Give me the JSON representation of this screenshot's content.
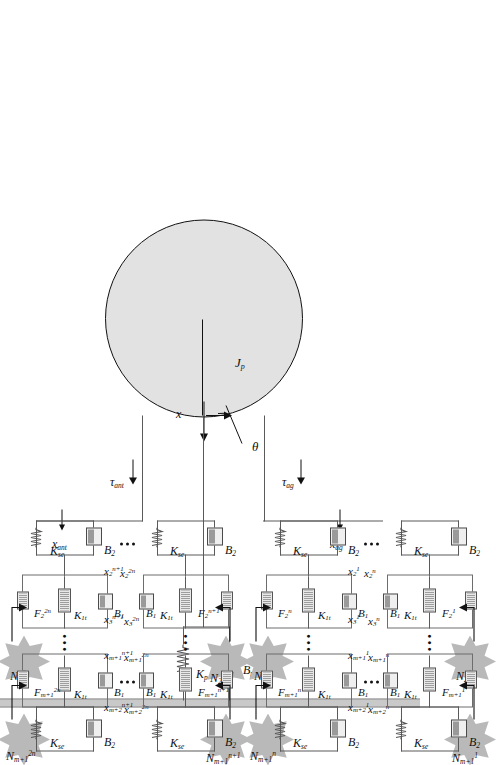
{
  "figure": {
    "type": "biomechanical-muscle-model-diagram",
    "orientation": "rotated-90-ccw",
    "rotor": {
      "inertia_label": "J",
      "inertia_sub": "p",
      "angle_label": "θ",
      "displacement_label": "x"
    },
    "torques": [
      {
        "name": "tau-antagonist",
        "base": "τ",
        "sub": "ant"
      },
      {
        "name": "tau-agonist",
        "base": "τ",
        "sub": "ag"
      }
    ],
    "tendon_displacements": [
      {
        "name": "x-antagonist",
        "base": "x",
        "sub": "ant"
      },
      {
        "name": "x-agonist",
        "base": "x",
        "sub": "ag"
      }
    ],
    "passive_elements": [
      {
        "name": "passive-stiffness",
        "base": "K",
        "sub": "p",
        "kind": "spring"
      },
      {
        "name": "passive-damping",
        "base": "B",
        "sub": "p",
        "kind": "damper"
      }
    ],
    "series_elements": {
      "base": "K",
      "sub": "se",
      "kind": "spring"
    },
    "parallel_damper": {
      "base": "B",
      "sub": "2",
      "kind": "damper"
    },
    "contractile_stiffness": {
      "base": "K",
      "sub": "1t",
      "kind": "spring"
    },
    "contractile_damper": {
      "base": "B",
      "sub": "1",
      "kind": "damper"
    },
    "ellipsis": "•••",
    "groups": [
      {
        "name": "antagonist-upper-group",
        "layer_sup": "2n",
        "forces": [
          {
            "base": "F",
            "sub": "2",
            "sup": "2n"
          },
          {
            "base": "F",
            "sub": "m+1",
            "sup": "2n"
          }
        ],
        "neural_inputs": [
          {
            "base": "N",
            "sub": "2",
            "sup": "2n"
          },
          {
            "base": "N",
            "sub": "m+1",
            "sup": "2n"
          }
        ],
        "node_displacements": [
          {
            "base": "x",
            "sub": "2",
            "sup": "2n"
          },
          {
            "base": "x",
            "sub": "3",
            "sup": "2n"
          },
          {
            "base": "x",
            "sub": "m+1",
            "sup": "2n"
          },
          {
            "base": "x",
            "sub": "m+2",
            "sup": "2n"
          }
        ]
      },
      {
        "name": "antagonist-lower-group",
        "layer_sup": "n+1",
        "forces": [
          {
            "base": "F",
            "sub": "2",
            "sup": "n+1"
          },
          {
            "base": "F",
            "sub": "m+1",
            "sup": "n+1"
          }
        ],
        "neural_inputs": [
          {
            "base": "N",
            "sub": "2",
            "sup": "n+1"
          },
          {
            "base": "N",
            "sub": "m+1",
            "sup": "n+1"
          }
        ],
        "node_displacements": [
          {
            "base": "x",
            "sub": "2",
            "sup": "n+1"
          },
          {
            "base": "x",
            "sub": "3",
            "sup": "n+1"
          },
          {
            "base": "x",
            "sub": "m+1",
            "sup": "n+1"
          },
          {
            "base": "x",
            "sub": "m+2",
            "sup": "n+1"
          }
        ]
      },
      {
        "name": "agonist-upper-group",
        "layer_sup": "n",
        "forces": [
          {
            "base": "F",
            "sub": "2",
            "sup": "n"
          },
          {
            "base": "F",
            "sub": "m+1",
            "sup": "n"
          }
        ],
        "neural_inputs": [
          {
            "base": "N",
            "sub": "2",
            "sup": "n"
          },
          {
            "base": "N",
            "sub": "m+1",
            "sup": "n"
          }
        ],
        "node_displacements": [
          {
            "base": "x",
            "sub": "2",
            "sup": "n"
          },
          {
            "base": "x",
            "sub": "3",
            "sup": "n"
          },
          {
            "base": "x",
            "sub": "m+1",
            "sup": "n"
          },
          {
            "base": "x",
            "sub": "m+2",
            "sup": "n"
          }
        ]
      },
      {
        "name": "agonist-lower-group",
        "layer_sup": "1",
        "forces": [
          {
            "base": "F",
            "sub": "2",
            "sup": "1"
          },
          {
            "base": "F",
            "sub": "m+1",
            "sup": "1"
          }
        ],
        "neural_inputs": [
          {
            "base": "N",
            "sub": "2",
            "sup": "1"
          },
          {
            "base": "N",
            "sub": "m+1",
            "sup": "1"
          }
        ],
        "node_displacements": [
          {
            "base": "x",
            "sub": "2",
            "sup": "1"
          },
          {
            "base": "x",
            "sub": "3",
            "sup": "1"
          },
          {
            "base": "x",
            "sub": "m+1",
            "sup": "1"
          },
          {
            "base": "x",
            "sub": "m+2",
            "sup": "1"
          }
        ]
      }
    ],
    "colors": {
      "star_fill": "#b9b9b9",
      "rotor_fill": "#e2e2e2",
      "wall_fill": "#c9c9c9",
      "line": "#5a5a5a",
      "text": "#111111"
    }
  }
}
